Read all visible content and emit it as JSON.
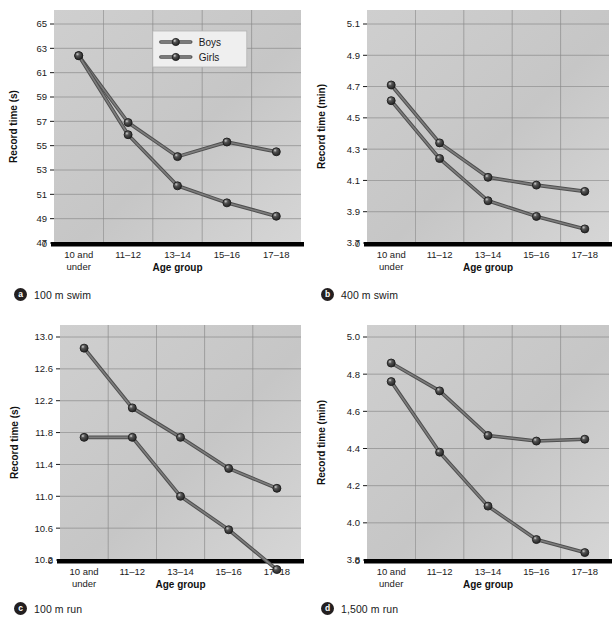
{
  "figure": {
    "series_names": [
      "Boys",
      "Girls"
    ],
    "x_axis_title": "Age group",
    "categories": [
      "10 and\nunder",
      "11–12",
      "13–14",
      "15–16",
      "17–18"
    ],
    "legend": {
      "panel": "a",
      "items": [
        "Boys",
        "Girls"
      ]
    },
    "colors": {
      "plot_background": "#c9c9c9",
      "gridline": "#8a8a8a",
      "line": "#6e6e6e",
      "marker_fill": "#3a3a3a",
      "axis": "#000000",
      "text": "#1a1a1a"
    }
  },
  "panels": [
    {
      "key": "a",
      "badge": "a",
      "caption": "100 m swim",
      "chart_data": {
        "type": "line",
        "title": "100 m swim",
        "xlabel": "Age group",
        "ylabel": "Record time (s)",
        "categories": [
          "10 and under",
          "11–12",
          "13–14",
          "15–16",
          "17–18"
        ],
        "yticks": [
          47,
          49,
          51,
          53,
          55,
          57,
          59,
          61,
          63,
          65
        ],
        "ytick_labels": [
          "47",
          "49",
          "51",
          "53",
          "55",
          "57",
          "59",
          "61",
          "63",
          "65"
        ],
        "axis_break_label": "0",
        "ylim": [
          47,
          65
        ],
        "grid": true,
        "legend_position": "upper center",
        "series": [
          {
            "name": "Boys",
            "values": [
              62.4,
              56.9,
              54.1,
              55.3,
              54.5
            ]
          },
          {
            "name": "Girls",
            "values": [
              62.4,
              55.9,
              51.7,
              50.3,
              49.2
            ]
          }
        ]
      }
    },
    {
      "key": "b",
      "badge": "b",
      "caption": "400 m swim",
      "chart_data": {
        "type": "line",
        "title": "400 m swim",
        "xlabel": "Age group",
        "ylabel": "Record time (min)",
        "categories": [
          "10 and under",
          "11–12",
          "13–14",
          "15–16",
          "17–18"
        ],
        "yticks": [
          3.7,
          3.9,
          4.1,
          4.3,
          4.5,
          4.7,
          4.9,
          5.1
        ],
        "ytick_labels": [
          "3.7",
          "3.9",
          "4.1",
          "4.3",
          "4.5",
          "4.7",
          "4.9",
          "5.1"
        ],
        "axis_break_label": "0",
        "ylim": [
          3.7,
          5.1
        ],
        "grid": true,
        "legend_position": "none",
        "series": [
          {
            "name": "Boys",
            "values": [
              4.71,
              4.34,
              4.12,
              4.07,
              4.03
            ]
          },
          {
            "name": "Girls",
            "values": [
              4.61,
              4.24,
              3.97,
              3.87,
              3.79
            ]
          }
        ]
      }
    },
    {
      "key": "c",
      "badge": "c",
      "caption": "100 m run",
      "chart_data": {
        "type": "line",
        "title": "100 m run",
        "xlabel": "Age group",
        "ylabel": "Record time (s)",
        "categories": [
          "10 and under",
          "11–12",
          "13–14",
          "15–16",
          "17–18"
        ],
        "yticks": [
          10.2,
          10.6,
          11.0,
          11.4,
          11.8,
          12.2,
          12.6,
          13.0
        ],
        "ytick_labels": [
          "10.2",
          "10.6",
          "11.0",
          "11.4",
          "11.8",
          "12.2",
          "12.6",
          "13.0"
        ],
        "axis_break_label": "0",
        "ylim": [
          10.2,
          13.0
        ],
        "grid": true,
        "legend_position": "none",
        "series": [
          {
            "name": "Boys",
            "values": [
              11.74,
              11.74,
              11.0,
              10.58,
              10.08
            ]
          },
          {
            "name": "Girls",
            "values": [
              12.86,
              12.11,
              11.74,
              11.35,
              11.1
            ]
          }
        ]
      }
    },
    {
      "key": "d",
      "badge": "d",
      "caption": "1,500 m run",
      "chart_data": {
        "type": "line",
        "title": "1,500 m run",
        "xlabel": "Age group",
        "ylabel": "Record time (min)",
        "categories": [
          "10 and under",
          "11–12",
          "13–14",
          "15–16",
          "17–18"
        ],
        "yticks": [
          3.8,
          4.0,
          4.2,
          4.4,
          4.6,
          4.8,
          5.0
        ],
        "ytick_labels": [
          "3.8",
          "4.0",
          "4.2",
          "4.4",
          "4.6",
          "4.8",
          "5.0"
        ],
        "axis_break_label": "0",
        "ylim": [
          3.8,
          5.0
        ],
        "grid": true,
        "legend_position": "none",
        "series": [
          {
            "name": "Boys",
            "values": [
              4.76,
              4.38,
              4.09,
              3.91,
              3.84
            ]
          },
          {
            "name": "Girls",
            "values": [
              4.86,
              4.71,
              4.47,
              4.44,
              4.45
            ]
          }
        ]
      }
    }
  ]
}
